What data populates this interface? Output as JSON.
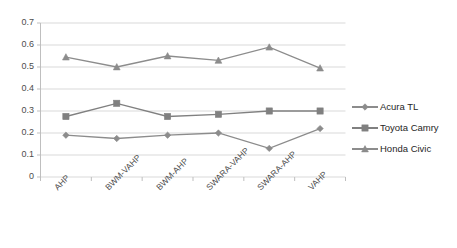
{
  "chart_data": {
    "type": "line",
    "title": "",
    "xlabel": "",
    "ylabel": "",
    "categories": [
      "AHP",
      "BWM-VAHP",
      "BWM-AHP",
      "SWARA-VAHP",
      "SWARA-AHP",
      "VAHP"
    ],
    "ylim": [
      0,
      0.7
    ],
    "ytick_labels": [
      "0",
      "0.1",
      "0.2",
      "0.3",
      "0.4",
      "0.5",
      "0.6",
      "0.7"
    ],
    "ytick_values": [
      0,
      0.1,
      0.2,
      0.3,
      0.4,
      0.5,
      0.6,
      0.7
    ],
    "grid": true,
    "legend_position": "right",
    "series": [
      {
        "name": "Acura TL",
        "marker": "diamond",
        "color": "#8c8c8c",
        "values": [
          0.19,
          0.175,
          0.19,
          0.2,
          0.13,
          0.22
        ]
      },
      {
        "name": "Toyota Camry",
        "marker": "square",
        "color": "#808080",
        "values": [
          0.275,
          0.335,
          0.275,
          0.285,
          0.3,
          0.3
        ]
      },
      {
        "name": "Honda Civic",
        "marker": "triangle",
        "color": "#8c8c8c",
        "values": [
          0.545,
          0.5,
          0.55,
          0.53,
          0.59,
          0.495
        ]
      }
    ]
  },
  "colors": {
    "grid": "#d9d9d9",
    "axis": "#bfbfbf",
    "series_gray": "#8c8c8c",
    "text": "#404040",
    "background": "#ffffff"
  }
}
